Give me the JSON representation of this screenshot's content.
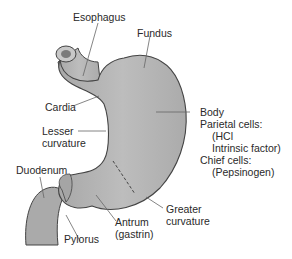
{
  "diagram": {
    "fill_color": "#b3b3b3",
    "outline_color": "#444444",
    "leader_color": "#666666",
    "labels": {
      "esophagus": "Esophagus",
      "fundus": "Fundus",
      "cardia": "Cardia",
      "lesser_curvature_1": "Lesser",
      "lesser_curvature_2": "curvature",
      "body": "Body",
      "parietal_cells": "Parietal cells:",
      "hcl": "(HCl",
      "intrinsic_factor": "Intrinsic factor)",
      "chief_cells": "Chief cells:",
      "pepsinogen": "(Pepsinogen)",
      "duodenum": "Duodenum",
      "pylorus": "Pylorus",
      "antrum": "Antrum",
      "gastrin": "(gastrin)",
      "greater_curvature_1": "Greater",
      "greater_curvature_2": "curvature"
    }
  }
}
